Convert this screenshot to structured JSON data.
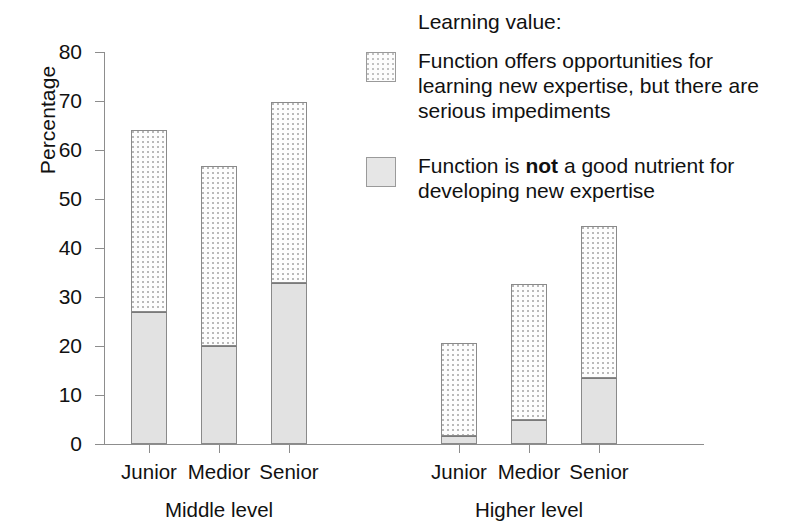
{
  "chart_data": {
    "type": "bar",
    "subtype": "stacked-bar",
    "title": "",
    "xlabel": "",
    "ylabel": "Percentage",
    "ylim": [
      0,
      80
    ],
    "yticks": [
      0,
      10,
      20,
      30,
      40,
      50,
      60,
      70,
      80
    ],
    "ytick_labels": [
      "0",
      "10",
      "20",
      "30",
      "40",
      "50",
      "60",
      "70",
      "80"
    ],
    "grid": false,
    "legend_position": "right",
    "legend_title": "Learning value:",
    "categories": [
      "Junior",
      "Medior",
      "Senior",
      "Junior",
      "Medior",
      "Senior"
    ],
    "groups": [
      {
        "name": "Middle level",
        "categories": [
          "Junior",
          "Medior",
          "Senior"
        ]
      },
      {
        "name": "Higher level",
        "categories": [
          "Junior",
          "Medior",
          "Senior"
        ]
      }
    ],
    "series": [
      {
        "name": "Function is not a good nutrient for developing new expertise",
        "short_name": "not-a-good-nutrient",
        "fill": "solid-gray",
        "color": "#e2e2e2",
        "values": [
          27.0,
          20.0,
          32.8,
          1.7,
          4.8,
          13.5
        ]
      },
      {
        "name": "Function offers opportunities for learning new expertise, but there are serious impediments",
        "short_name": "offers-opportunities",
        "fill": "dotted",
        "color": "#fdfdfd",
        "values": [
          37.0,
          36.8,
          37.0,
          19.0,
          27.8,
          31.0
        ]
      }
    ],
    "totals": [
      64.0,
      56.8,
      69.8,
      20.7,
      32.6,
      44.5
    ]
  },
  "axis": {
    "y_title": "Percentage",
    "y_tick_labels": [
      "80",
      "70",
      "60",
      "50",
      "40",
      "30",
      "20",
      "10",
      "0"
    ]
  },
  "legend": {
    "title": "Learning value:",
    "entries": [
      {
        "swatch": "dotted",
        "line1": "Function offers opportunities for",
        "line2": "learning new expertise, but there are",
        "line3": "serious impediments"
      },
      {
        "swatch": "solid",
        "pre": "Function is ",
        "emphasis": "not",
        "post": " a good nutrient for",
        "line2": "developing new expertise"
      }
    ]
  },
  "x_axis": {
    "tick_labels": [
      "Junior",
      "Medior",
      "Senior",
      "Junior",
      "Medior",
      "Senior"
    ],
    "group_labels": [
      "Middle level",
      "Higher level"
    ]
  }
}
